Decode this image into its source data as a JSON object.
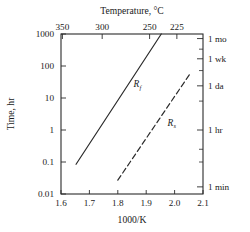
{
  "chart_data": {
    "type": "line",
    "title": "",
    "xlabel": "1000/K",
    "ylabel": "Time, hr",
    "top_axis_label": "Temperature, °C",
    "right_axis_label": "",
    "xlim": [
      1.6,
      2.1
    ],
    "ylim": [
      0.01,
      1000
    ],
    "yscale": "log",
    "grid": false,
    "legend_position": "inline-annotations",
    "x_ticks": [
      "1.6",
      "1.7",
      "1.8",
      "1.9",
      "2.0",
      "2.1"
    ],
    "x_tick_values": [
      1.6,
      1.7,
      1.8,
      1.9,
      2.0,
      2.1
    ],
    "y_ticks": [
      "1000",
      "100",
      "10",
      "1",
      "0.1",
      "0.01"
    ],
    "y_tick_values": [
      1000,
      100,
      10,
      1,
      0.1,
      0.01
    ],
    "top_ticks": [
      "350",
      "300",
      "250",
      "225"
    ],
    "top_tick_x_values": [
      1.605,
      1.745,
      1.912,
      2.008
    ],
    "right_ticks": [
      {
        "label": "1 mo",
        "value": 720
      },
      {
        "label": "1 wk",
        "value": 168
      },
      {
        "label": "1 da",
        "value": 24
      },
      {
        "label": "1 hr",
        "value": 1
      },
      {
        "label": "1 min",
        "value": 0.0167
      }
    ],
    "right_minor_ticks": [
      336,
      72,
      8,
      0.25,
      0.1
    ],
    "series": [
      {
        "name": "Rf",
        "label": "R",
        "sublabel": "f",
        "style": "solid",
        "color": "#2b2b2b",
        "x": [
          1.653,
          1.953
        ],
        "y": [
          0.085,
          1000
        ],
        "label_x": 1.855,
        "label_y": 22
      },
      {
        "name": "Rs",
        "label": "R",
        "sublabel": "s",
        "style": "dashed",
        "color": "#2b2b2b",
        "x": [
          1.8,
          2.053
        ],
        "y": [
          0.027,
          55
        ],
        "label_x": 1.975,
        "label_y": 1.35
      }
    ]
  },
  "colors": {
    "axis": "#2b2b2b",
    "text": "#1a1a1a",
    "background": "#ffffff"
  }
}
